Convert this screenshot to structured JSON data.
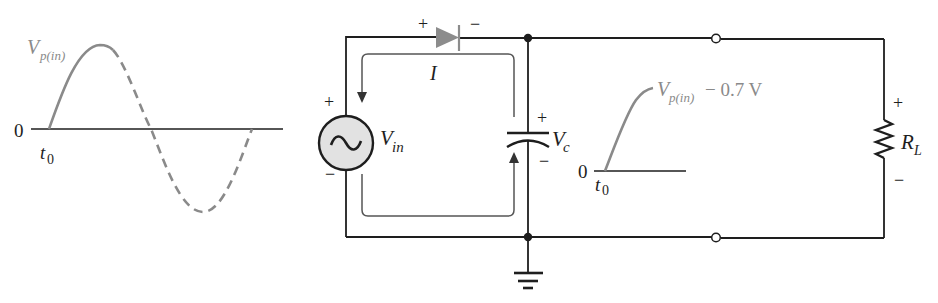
{
  "diagram": {
    "type": "half-wave rectifier with capacitor-input filter (initial charging)",
    "colors": {
      "wire": "#1e1e1e",
      "waveform": "#8a8a8a",
      "diode_fill": "#8c8c8c",
      "source_fill": "#e2e2e2",
      "current_arrow": "#555555"
    },
    "input_waveform": {
      "peak_label_main": "V",
      "peak_label_sub": "p(in)",
      "zero_label": "0",
      "time_label_main": "t",
      "time_label_sub": "0"
    },
    "circuit": {
      "diode": {
        "anode_sign": "+",
        "cathode_sign": "−"
      },
      "current_label": "I",
      "source": {
        "label_main": "V",
        "label_sub": "in",
        "plus": "+",
        "minus": "−",
        "icon": "ac-sine-icon"
      },
      "capacitor": {
        "label_main": "V",
        "label_sub": "c",
        "plus": "+",
        "minus": "−"
      },
      "load": {
        "label_main": "R",
        "label_sub": "L",
        "plus": "+",
        "minus": "−"
      },
      "ground": "ground-icon"
    },
    "output_waveform": {
      "peak_label_main": "V",
      "peak_label_sub": "p(in)",
      "peak_label_suffix": "− 0.7 V",
      "zero_label": "0",
      "time_label_main": "t",
      "time_label_sub": "0"
    }
  }
}
